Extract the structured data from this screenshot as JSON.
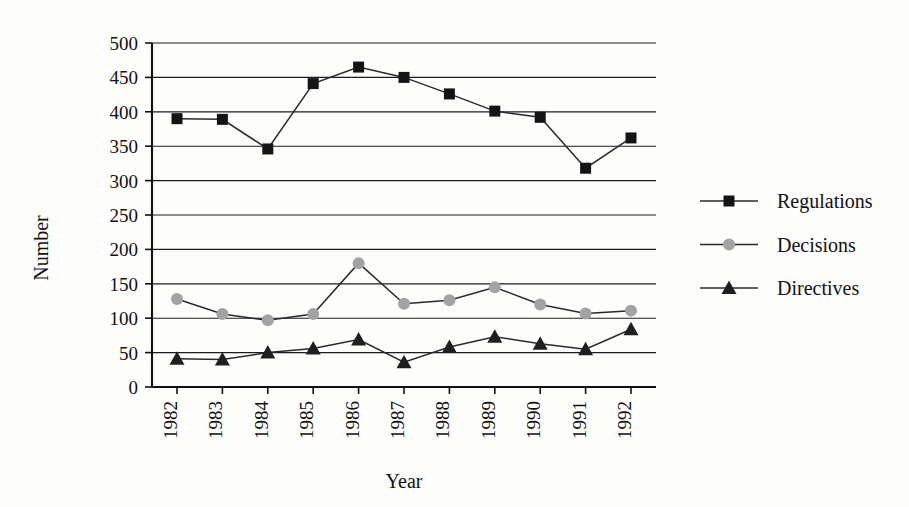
{
  "chart_data": {
    "type": "line",
    "title": "",
    "xlabel": "Year",
    "ylabel": "Number",
    "categories": [
      "1982",
      "1983",
      "1984",
      "1985",
      "1986",
      "1987",
      "1988",
      "1989",
      "1990",
      "1991",
      "1992"
    ],
    "x": [
      1982,
      1983,
      1984,
      1985,
      1986,
      1987,
      1988,
      1989,
      1990,
      1991,
      1992
    ],
    "ylim": [
      0,
      500
    ],
    "yticks": [
      0,
      50,
      100,
      150,
      200,
      250,
      300,
      350,
      400,
      450,
      500
    ],
    "ytick_labels": [
      "0",
      "50",
      "100",
      "150",
      "200",
      "250",
      "300",
      "350",
      "400",
      "450",
      "500"
    ],
    "grid": true,
    "grid_axis": "y",
    "legend_position": "right",
    "series": [
      {
        "name": "Regulations",
        "marker": "square",
        "color": "#141414",
        "values": [
          390,
          389,
          346,
          441,
          465,
          450,
          426,
          401,
          392,
          318,
          362
        ]
      },
      {
        "name": "Decisions",
        "marker": "circle",
        "color": "#a3a3a3",
        "values": [
          128,
          106,
          97,
          106,
          180,
          121,
          126,
          145,
          120,
          107,
          111
        ]
      },
      {
        "name": "Directives",
        "marker": "triangle",
        "color": "#1f1f1f",
        "values": [
          41,
          40,
          50,
          56,
          69,
          36,
          58,
          73,
          63,
          55,
          84
        ]
      }
    ]
  },
  "axes": {
    "y_axis_title": "Number",
    "x_axis_title": "Year"
  },
  "legend": {
    "items": [
      {
        "label": "Regulations"
      },
      {
        "label": "Decisions"
      },
      {
        "label": "Directives"
      }
    ]
  },
  "colors": {
    "regulations": "#141414",
    "decisions": "#a3a3a3",
    "directives": "#1f1f1f",
    "grid": "#1d1d1d",
    "axis": "#111111",
    "background": "#fdfdfb"
  }
}
